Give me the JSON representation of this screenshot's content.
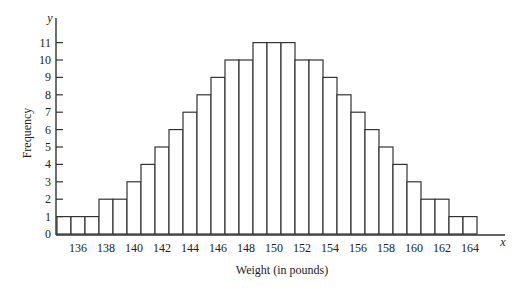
{
  "chart_data": {
    "type": "bar",
    "title": "",
    "xlabel": "Weight (in pounds)",
    "ylabel": "Frequency",
    "x_axis_var": "x",
    "y_axis_var": "y",
    "categories": [
      135,
      136,
      137,
      138,
      139,
      140,
      141,
      142,
      143,
      144,
      145,
      146,
      147,
      148,
      149,
      150,
      151,
      152,
      153,
      154,
      155,
      156,
      157,
      158,
      159,
      160,
      161,
      162,
      163,
      164
    ],
    "values": [
      1,
      1,
      1,
      2,
      2,
      3,
      4,
      5,
      6,
      7,
      8,
      9,
      10,
      10,
      11,
      11,
      11,
      10,
      10,
      9,
      8,
      7,
      6,
      5,
      4,
      3,
      2,
      2,
      1,
      1
    ],
    "x_tick_labels": [
      "136",
      "138",
      "140",
      "142",
      "144",
      "146",
      "148",
      "150",
      "152",
      "154",
      "156",
      "158",
      "160",
      "162",
      "164"
    ],
    "y_tick_labels": [
      "0",
      "1",
      "2",
      "3",
      "4",
      "5",
      "6",
      "7",
      "8",
      "9",
      "10",
      "11"
    ],
    "ylim": [
      0,
      11
    ],
    "grid": false,
    "legend": null
  },
  "layout": {
    "x0_px": 57,
    "bar_width_px": 14,
    "first_category": 135,
    "y0_px": 234,
    "unit_height_px": 17.4,
    "y_axis_top_px": 18,
    "x_axis_end_px": 505
  }
}
